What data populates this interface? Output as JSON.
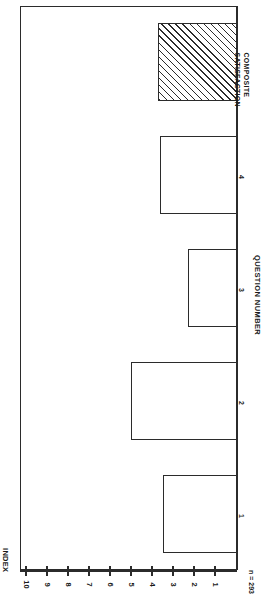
{
  "chart_data": {
    "type": "bar",
    "orientation": "rotated-90",
    "title": "",
    "xlabel": "QUESTION NUMBER",
    "ylabel": "INDEX",
    "ylim": [
      0,
      10
    ],
    "grid": false,
    "legend": null,
    "annotation": "n = 293",
    "tick_labels": [
      "10",
      "9",
      "8",
      "7",
      "6",
      "5",
      "4",
      "3",
      "2",
      "1"
    ],
    "ticks": [
      10,
      9,
      8,
      7,
      6,
      5,
      4,
      3,
      2,
      1
    ],
    "categories": [
      "1",
      "2",
      "3",
      "4",
      "COMPOSITE SATISFACTION"
    ],
    "values": [
      3.5,
      5.0,
      2.3,
      3.6,
      3.7
    ],
    "bars": [
      {
        "category": "1",
        "label_lines": [
          "1"
        ],
        "value": 3.5,
        "fill": "empty"
      },
      {
        "category": "2",
        "label_lines": [
          "2"
        ],
        "value": 5.0,
        "fill": "empty"
      },
      {
        "category": "3",
        "label_lines": [
          "3"
        ],
        "value": 2.3,
        "fill": "empty"
      },
      {
        "category": "4",
        "label_lines": [
          "4"
        ],
        "value": 3.6,
        "fill": "empty"
      },
      {
        "category": "COMPOSITE SATISFACTION",
        "label_lines": [
          "COMPOSITE",
          "SATISFACTION"
        ],
        "value": 3.7,
        "fill": "hatched"
      }
    ]
  },
  "axes": {
    "index_title": "INDEX",
    "question_title": "QUESTION NUMBER",
    "sample_size": "n = 293"
  },
  "tick_labels": {
    "t0": "10",
    "t1": "9",
    "t2": "8",
    "t3": "7",
    "t4": "6",
    "t5": "5",
    "t6": "4",
    "t7": "3",
    "t8": "2",
    "t9": "1"
  },
  "category_labels": {
    "c0": "1",
    "c1": "2",
    "c2": "3",
    "c3": "4",
    "c4_line1": "COMPOSITE",
    "c4_line2": "SATISFACTION"
  },
  "colors": {
    "ink": "#2b2b2b",
    "background": "#ffffff"
  }
}
